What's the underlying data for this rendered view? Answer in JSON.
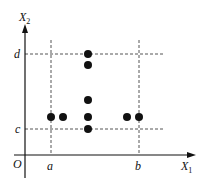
{
  "diagram": {
    "axes": {
      "x_label": "X",
      "x_label_sub": "1",
      "y_label": "X",
      "y_label_sub": "2",
      "origin_label": "O"
    },
    "ticks": {
      "x": [
        {
          "label": "a",
          "px": 51
        },
        {
          "label": "b",
          "px": 139
        }
      ],
      "y": [
        {
          "label": "d",
          "py": 54
        },
        {
          "label": "c",
          "py": 129
        }
      ]
    },
    "points": [
      {
        "x": 51,
        "y": 117
      },
      {
        "x": 63,
        "y": 117
      },
      {
        "x": 88,
        "y": 54
      },
      {
        "x": 88,
        "y": 65
      },
      {
        "x": 88,
        "y": 100
      },
      {
        "x": 88,
        "y": 117
      },
      {
        "x": 88,
        "y": 129
      },
      {
        "x": 127,
        "y": 117
      },
      {
        "x": 139,
        "y": 117
      }
    ],
    "colors": {
      "ink": "#111111",
      "dashed": "#555555"
    }
  }
}
